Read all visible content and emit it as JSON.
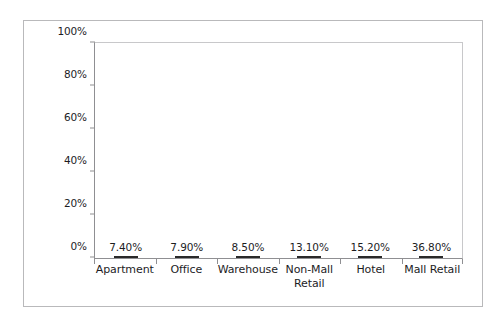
{
  "chart_data": {
    "type": "bar",
    "title": "",
    "xlabel": "",
    "ylabel": "",
    "categories": [
      "Apartment",
      "Office",
      "Warehouse",
      "Non-Mall Retail",
      "Hotel",
      "Mall Retail"
    ],
    "category_lines": [
      [
        "Apartment"
      ],
      [
        "Office"
      ],
      [
        "Warehouse"
      ],
      [
        "Non-Mall",
        "Retail"
      ],
      [
        "Hotel"
      ],
      [
        "Mall Retail"
      ]
    ],
    "values": [
      7.4,
      7.9,
      8.5,
      13.1,
      15.2,
      36.8
    ],
    "value_labels": [
      "7.40%",
      "7.90%",
      "8.50%",
      "13.10%",
      "15.20%",
      "36.80%"
    ],
    "ylim": [
      0,
      100
    ],
    "ytick_values": [
      0,
      20,
      40,
      60,
      80,
      100
    ],
    "ytick_labels": [
      "0%",
      "20%",
      "40%",
      "60%",
      "80%",
      "100%"
    ],
    "grid": false,
    "legend": false,
    "legend_position": "none",
    "bar_color": "#333333",
    "axis_color": "#8f8f92",
    "frame_color": "#b9b9bb",
    "background_color": "#ffffff",
    "text_color": "#1d1d1f"
  }
}
